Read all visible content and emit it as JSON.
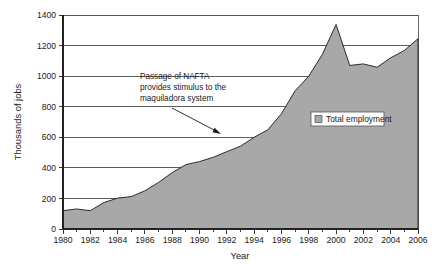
{
  "chart_data": {
    "type": "area",
    "title": "",
    "xlabel": "Year",
    "ylabel": "Thousands of jobs",
    "xlim": [
      1980,
      2006
    ],
    "ylim": [
      0,
      1400
    ],
    "ytick_step": 200,
    "xtick_step": 2,
    "grid": true,
    "legend_position": "inside-right",
    "yticks": [
      0,
      200,
      400,
      600,
      800,
      1000,
      1200,
      1400
    ],
    "ytick_labels": [
      "0",
      "200",
      "400",
      "600",
      "800",
      "1000",
      "1200",
      "1400"
    ],
    "xticks": [
      1980,
      1982,
      1984,
      1986,
      1988,
      1990,
      1992,
      1994,
      1996,
      1998,
      2000,
      2002,
      2004,
      2006
    ],
    "xtick_labels": [
      "1980",
      "1982",
      "1984",
      "1986",
      "1988",
      "1990",
      "1992",
      "1994",
      "1996",
      "1998",
      "2000",
      "2002",
      "2004",
      "2006"
    ],
    "series": [
      {
        "name": "Total employment",
        "color": "#a8a8a8",
        "x": [
          1980,
          1981,
          1982,
          1983,
          1984,
          1985,
          1986,
          1987,
          1988,
          1989,
          1990,
          1991,
          1992,
          1993,
          1994,
          1995,
          1996,
          1997,
          1998,
          1999,
          2000,
          2001,
          2002,
          2003,
          2004,
          2005,
          2006
        ],
        "values": [
          120,
          131,
          120,
          173,
          202,
          212,
          250,
          305,
          369,
          421,
          441,
          469,
          506,
          542,
          600,
          649,
          754,
          904,
          1000,
          1143,
          1338,
          1070,
          1080,
          1058,
          1120,
          1168,
          1245
        ]
      }
    ],
    "annotations": [
      {
        "name": "nafta-annotation",
        "lines": [
          "Passage of NAFTA",
          "provides stimulus to the",
          "maquiladora system"
        ],
        "points_to_year": 1994,
        "points_to_value": 610
      }
    ],
    "legend": [
      {
        "label": "Total employment",
        "color": "#a8a8a8"
      }
    ]
  }
}
